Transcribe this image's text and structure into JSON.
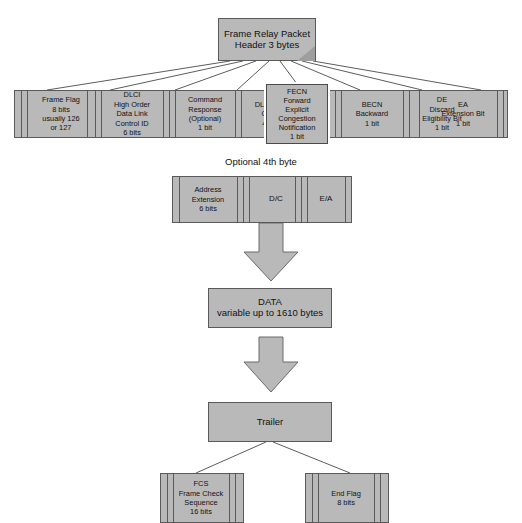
{
  "diagram": {
    "colors": {
      "fill": "#b9b9b9",
      "stroke": "#5a5a5a",
      "text": "#111111",
      "background": "#ffffff",
      "highlight_outline": "#ffffff"
    },
    "header_box": {
      "label": "Frame Relay Packet\nHeader 3 bytes"
    },
    "header_fields": [
      {
        "name": "frame-flag",
        "label": "Frame Flag\n8 bits\nusually 126\nor 127"
      },
      {
        "name": "dlci-high-order",
        "label": "DLCI\nHigh Order\nData Link\nControl ID\n6 bits"
      },
      {
        "name": "command-response",
        "label": "Command\nResponse\n(Optional)\n1 bit"
      },
      {
        "name": "dlci-low-order",
        "label": "DLCI Low\nOrder\n4 bits"
      },
      {
        "name": "fecn",
        "label": "FECN\nForward\nExplicit\nCongestion\nNotification\n1 bit"
      },
      {
        "name": "becn",
        "label": "BECN\nBackward\n1 bit"
      },
      {
        "name": "de",
        "label": "DE\nDiscard\nEligibility Bit\n1 bit"
      },
      {
        "name": "ea",
        "label": "EA\nExtension Bit\n1 bit"
      }
    ],
    "optional_byte": {
      "caption": "Optional 4th byte",
      "fields": [
        {
          "name": "address-extension",
          "label": "Address\nExtension\n6 bits"
        },
        {
          "name": "dc",
          "label": "D/C"
        },
        {
          "name": "ea",
          "label": "E/A"
        }
      ]
    },
    "data_box": {
      "label": "DATA\nvariable up to 1610 bytes"
    },
    "trailer_box": {
      "label": "Trailer"
    },
    "trailer_fields": [
      {
        "name": "fcs",
        "label": "FCS\nFrame Check\nSequence\n16 bits"
      },
      {
        "name": "end-flag",
        "label": "End Flag\n8 bits"
      }
    ]
  }
}
